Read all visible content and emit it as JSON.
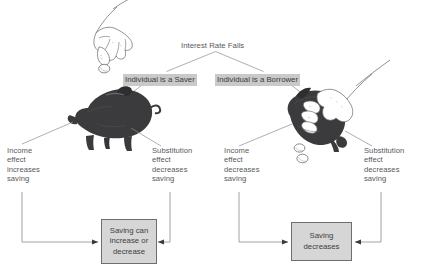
{
  "diagram": {
    "title": "Interest Rate Falls",
    "root": {
      "label": "Interest Rate Falls"
    },
    "branches": [
      {
        "id": "saver",
        "label": "Individual is a Saver",
        "illustration": "hand-dropping-coin-into-piggy-bank-icon",
        "effects": [
          {
            "id": "saver-income",
            "label": "Income\neffect\nincreases\nsaving"
          },
          {
            "id": "saver-substitution",
            "label": "Substitution\neffect\ndecreases\nsaving"
          }
        ],
        "outcome": {
          "id": "saving-can-increase-or-decrease",
          "label": "Saving can\nincrease or\ndecrease"
        }
      },
      {
        "id": "borrower",
        "label": "Individual is a Borrower",
        "illustration": "hand-shaking-coins-out-of-piggy-bank-icon",
        "effects": [
          {
            "id": "borrower-income",
            "label": "Income\neffect\ndecreases\nsaving"
          },
          {
            "id": "borrower-substitution",
            "label": "Substitution\neffect\ndecreases\nsaving"
          }
        ],
        "outcome": {
          "id": "saving-decreases",
          "label": "Saving\ndecreases"
        }
      }
    ],
    "colors": {
      "text": "#58595b",
      "highlight_background": "#c9c9c9",
      "box_fill": "#d6d6d6",
      "box_border": "#6e6e70",
      "connector": "#8b8c8e",
      "piggy_bank": "#3b3b3d"
    }
  }
}
